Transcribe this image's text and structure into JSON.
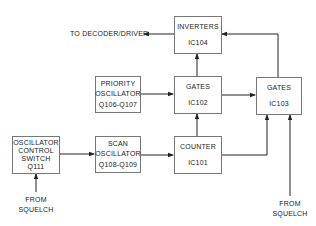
{
  "diagram": {
    "blocks": {
      "inverters": {
        "title": "INVERTERS",
        "id": "IC104"
      },
      "priority_osc": {
        "line1": "PRIORITY",
        "line2": "OSCILLATOR",
        "id": "Q106-Q107"
      },
      "gates_102": {
        "title": "GATES",
        "id": "IC102"
      },
      "gates_103": {
        "title": "GATES",
        "id": "IC103"
      },
      "osc_control": {
        "line1": "OSCILLATOR",
        "line2": "CONTROL",
        "line3": "SWITCH",
        "id": "Q111"
      },
      "scan_osc": {
        "line1": "SCAN",
        "line2": "OSCILLATOR",
        "id": "Q108-Q109"
      },
      "counter": {
        "title": "COUNTER",
        "id": "IC101"
      }
    },
    "labels": {
      "to_decoder": "TO DECODER/DRIVER",
      "from_squelch_left_1": "FROM",
      "from_squelch_left_2": "SQUELCH",
      "from_squelch_right_1": "FROM",
      "from_squelch_right_2": "SQUELCH"
    },
    "colors": {
      "line": "#222222",
      "box_border": "#777777"
    }
  }
}
